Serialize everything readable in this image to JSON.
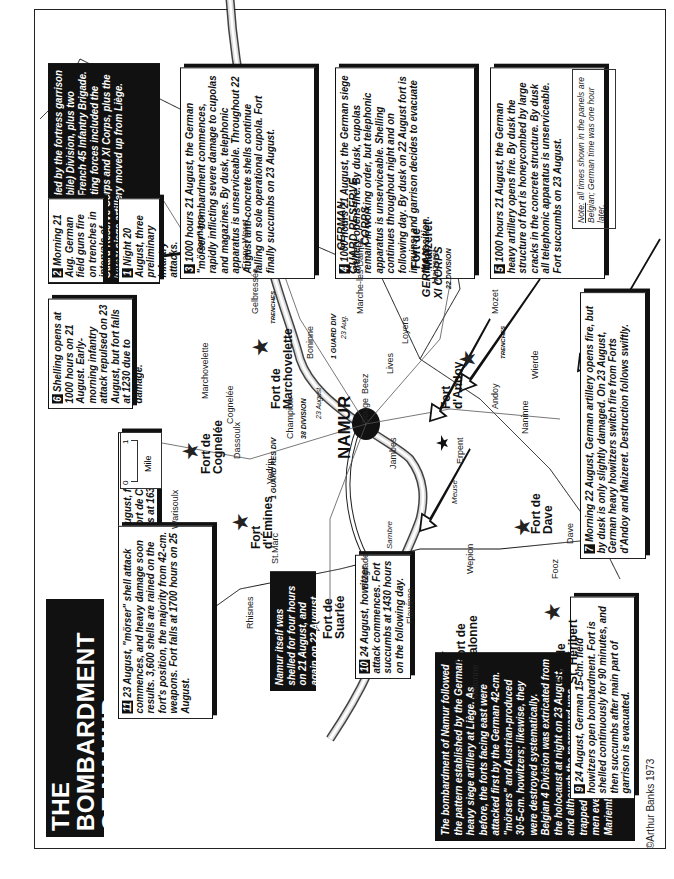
{
  "title": {
    "line1": "THE BOMBARDMENT OF NAMUR",
    "line2": "21-25 AUGUST 1914"
  },
  "scale": {
    "zero": "0",
    "one": "1",
    "unit": "Mile"
  },
  "note": {
    "label": "Note:",
    "text": "all times shown in the panels are Belgian; German time was one hour later."
  },
  "intro_panel": "Namur was defended by the fortress garrison and 4 Belgian (Mobile) Division, plus two companies of the French 45 Infantry Brigade. The German investing forces included the Guard Reserve Corps and XI Corps, plus the heavy siege artillery moved up from Liège.",
  "summary_panel": "The bombardment of Namur followed the pattern established by the German heavy siege artillery at Liège. As before, the forts facing east were attacked first by the German 42-cm. \"mörsers\" and Austrian-produced 30·5-cm. howitzers; likewise, they were destroyed systematically. Belgian 4 Division was extricated from the holocaust at night on 23 August, and although the rearguard was trapped at Ermeton-sur-Biert, 12,000 men eventually reached Antwerp via Mariembourg on 30 August.",
  "namur_panel": "Namur itself was shelled for four hours on 21 August, and again on 22 August.",
  "panels": [
    {
      "num": "1",
      "text": "Night 20 August, three preliminary infantry attacks."
    },
    {
      "num": "2",
      "text": "Morning 21 Aug. German field guns fire on trenches in intervals of forts."
    },
    {
      "num": "3",
      "text": "1000 hours 21 August, the German \"mörser\" bombardment commences, rapidly inflicting severe damage to cupolas and magazines. By dusk, telephonic apparatus is unserviceable. Throughout 22 August anti-concrete shells continue falling on sole operational cupola. Fort finally succumbs on 23 August."
    },
    {
      "num": "4",
      "text": "1000 hours 21 August, the German siege artillery opens fire. By dusk, cupolas remain in working order, but telephonic apparatus is unserviceable. Shelling continues throughout night and on following day. By dusk on 22 August fort is in ruins, and garrison decides to evacuate the position."
    },
    {
      "num": "5",
      "text": "1000 hours 21 August, the German heavy artillery opens fire. By dusk the structure of fort is honeycombed by large cracks in the concrete structure. By dusk all telephonic apparatus is unserviceable. Fort succumbs on 23 August."
    },
    {
      "num": "6",
      "text": "Shelling opens at 1000 hours on 21 August. Early-morning infantry attack repulsed on 23 August, but fort falls at 1230 due to damage."
    },
    {
      "num": "7",
      "text": "Morning 22 August, German artillery opens fire, but by dusk is only slightly damaged. On 23 August, German heavy howitzers switch fire from Forts d'Andoy and Maizeret. Destruction follows swiftly."
    },
    {
      "num": "8",
      "text": "23 August, fire shifted from Fort de Cognelée; fort falls at 1630, 24 Aug."
    },
    {
      "num": "9",
      "text": "24 August, German 15-cm. field howitzers open bombardment. Fort is shelled continuously for 90 minutes, and then succumbs after main part of garrison is evacuated."
    },
    {
      "num": "10",
      "text": "24 August, howitzer attack commences. Fort succumbs at 1430 hours on the following day."
    },
    {
      "num": "11",
      "text": "23 August, \"mörser\" shell attack commences, and heavy damage soon results. 3,600 shells are rained on the fort's position, the majority from 42-cm. weapons. Fort falls at 1700 hours on 25 August."
    }
  ],
  "forts": {
    "cognelee": [
      "Fort de",
      "Cognelée"
    ],
    "marchovelette": [
      "Fort de",
      "Marchovelette"
    ],
    "maizeret": [
      "Fort de",
      "Maizeret"
    ],
    "andoy": [
      "Fort",
      "d'Andoy"
    ],
    "dave": [
      "Fort de",
      "Dave"
    ],
    "emines": [
      "Fort",
      "d'Émines"
    ],
    "suarlee": [
      "Fort de",
      "Suarlée"
    ],
    "malonne": [
      "Fort de",
      "Malonne"
    ],
    "heribert": [
      "Fort de",
      "St. Héribert"
    ]
  },
  "places": {
    "warisoulx": "Warisoulx",
    "marchovelette": "Marchovelette",
    "cognelee": "Cognelée",
    "dassoulx": "Dassoulx",
    "champion": "Champion",
    "vedrin": "Vedrin",
    "boninne": "Boninne",
    "gelbressee": "Gelbressée",
    "franc_waret": "Franc-Waret",
    "marche_les_dames": "Marche-les-Dames",
    "maizeret": "Maizeret",
    "loyers": "Loyers",
    "lives": "Lives",
    "beez": "Beez",
    "bouge": "Bouge",
    "jambes": "Jambes",
    "erpent": "Erpent",
    "andoy": "Andoy",
    "naninne": "Naninne",
    "wierde": "Wierde",
    "mozet": "Mozet",
    "dave": "Dave",
    "fooz": "Fooz",
    "wepion": "Wepion",
    "st_marc": "St.Marc",
    "belgrade": "Belgrade",
    "flawinne": "Flawinne",
    "rhisnes": "Rhisnes",
    "malonne": "Malonne",
    "meuse": "Meuse",
    "sambre": "Sambre"
  },
  "city": "NAMUR",
  "corps": {
    "guard_reserve": "GERMAN GUARD RESERVE CORPS",
    "guard_l1": "GERMAN",
    "guard_l2": "GUARD RESERVE",
    "guard_l3": "CORPS",
    "xi_l1": "GERMAN",
    "xi_l2": "XI CORPS"
  },
  "units": {
    "germans": "Germans",
    "guard_div_1": "1 GUARD DIV",
    "guard_res_div_1": "1 GUARD RES DIV",
    "div_38": "38 DIVISION",
    "div_22": "22 DIVISION",
    "date_23aug": "23 Aug.",
    "date_23august": "23 August",
    "trenches": "TRENCHES"
  },
  "copyright": "©Arthur Banks 1973"
}
